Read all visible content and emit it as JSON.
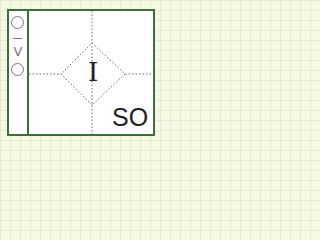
{
  "diagram": {
    "side_symbols": [
      {
        "name": "circle",
        "glyph": "○"
      },
      {
        "name": "dash",
        "glyph": "–"
      },
      {
        "name": "chevron-down",
        "glyph": "V"
      },
      {
        "name": "circle",
        "glyph": "○"
      }
    ],
    "center_label": "I",
    "corner_label": "SO",
    "colors": {
      "border": "#3f6e3a",
      "background": "#f6f8e6",
      "dotted_lines": "#666666"
    }
  }
}
